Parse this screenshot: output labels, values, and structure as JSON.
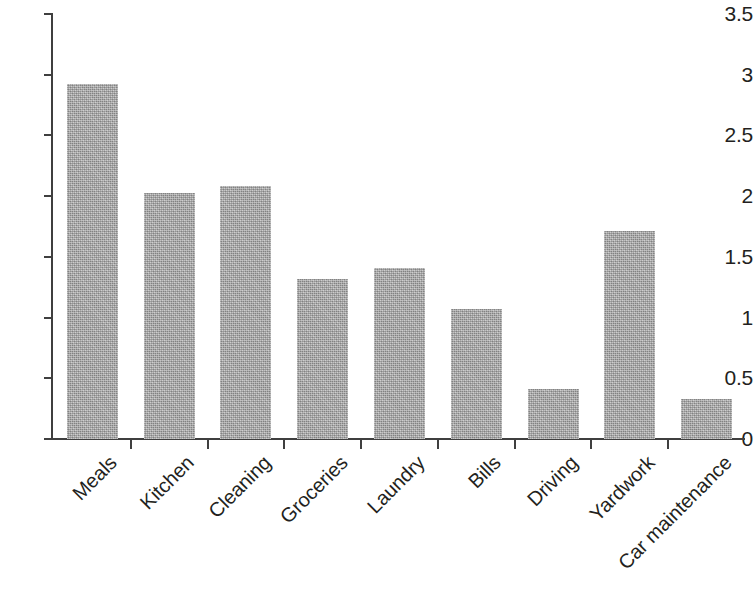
{
  "chart_data": {
    "type": "bar",
    "title": "",
    "subtitle": "",
    "xlabel": "",
    "ylabel": "",
    "ylim": [
      0,
      3.5
    ],
    "ytick_labels": [
      "0",
      "0.5",
      "1",
      "1.5",
      "2",
      "2.5",
      "3",
      "3.5"
    ],
    "ytick_values": [
      0,
      0.5,
      1,
      1.5,
      2,
      2.5,
      3,
      3.5
    ],
    "grid": false,
    "legend": null,
    "bar_color": "#a9a9a9",
    "axis_color": "#3f3f3f",
    "text_color": "#231f20",
    "xtick_label_rotation": -45,
    "categories": [
      "Meals",
      "Kitchen",
      "Cleaning",
      "Groceries",
      "Laundry",
      "Bills",
      "Driving",
      "Yardwork",
      "Car maintenance"
    ],
    "values": [
      2.92,
      2.03,
      2.08,
      1.32,
      1.41,
      1.07,
      0.41,
      1.71,
      0.33
    ]
  }
}
